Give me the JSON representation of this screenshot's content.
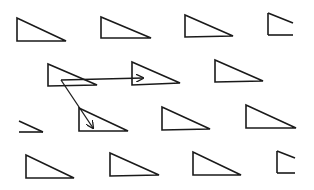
{
  "diagram": {
    "type": "translation-vectors-lattice",
    "stroke_color": "#1a1a1a",
    "background": "#ffffff",
    "triangles": [
      {
        "id": "r1c1",
        "points": [
          [
            17,
            18
          ],
          [
            17,
            41
          ],
          [
            66,
            41
          ]
        ]
      },
      {
        "id": "r1c2",
        "points": [
          [
            101,
            17
          ],
          [
            101,
            38
          ],
          [
            151,
            38
          ]
        ]
      },
      {
        "id": "r1c3",
        "points": [
          [
            185,
            15
          ],
          [
            185,
            37
          ],
          [
            233,
            36
          ]
        ]
      },
      {
        "id": "r2c1",
        "points": [
          [
            48,
            64
          ],
          [
            48,
            86
          ],
          [
            97,
            85
          ]
        ]
      },
      {
        "id": "r2c2",
        "points": [
          [
            132,
            62
          ],
          [
            132,
            85
          ],
          [
            180,
            83
          ]
        ]
      },
      {
        "id": "r2c3",
        "points": [
          [
            215,
            60
          ],
          [
            215,
            82
          ],
          [
            263,
            81
          ]
        ]
      },
      {
        "id": "r3c1",
        "points": [
          [
            79,
            108
          ],
          [
            79,
            131
          ],
          [
            128,
            131
          ]
        ]
      },
      {
        "id": "r3c2",
        "points": [
          [
            162,
            107
          ],
          [
            162,
            130
          ],
          [
            210,
            129
          ]
        ]
      },
      {
        "id": "r3c3",
        "points": [
          [
            246,
            105
          ],
          [
            246,
            128
          ],
          [
            296,
            128
          ]
        ]
      },
      {
        "id": "r4c1",
        "points": [
          [
            26,
            155
          ],
          [
            26,
            178
          ],
          [
            74,
            178
          ]
        ]
      },
      {
        "id": "r4c2",
        "points": [
          [
            110,
            153
          ],
          [
            110,
            176
          ],
          [
            159,
            175
          ]
        ]
      },
      {
        "id": "r4c3",
        "points": [
          [
            193,
            152
          ],
          [
            193,
            175
          ],
          [
            241,
            175
          ]
        ]
      }
    ],
    "partial_triangles": [
      {
        "id": "r1c4-cut",
        "segments": [
          [
            [
              268,
              13
            ],
            [
              268,
              35
            ]
          ],
          [
            [
              268,
              35
            ],
            [
              293,
              35
            ]
          ],
          [
            [
              268,
              13
            ],
            [
              293,
              23
            ]
          ]
        ]
      },
      {
        "id": "r3c0-cut",
        "segments": [
          [
            [
              19,
              121
            ],
            [
              43,
              132
            ]
          ],
          [
            [
              19,
              132
            ],
            [
              43,
              132
            ]
          ]
        ]
      },
      {
        "id": "r4c4-cut",
        "segments": [
          [
            [
              277,
              151
            ],
            [
              277,
              173
            ]
          ],
          [
            [
              277,
              173
            ],
            [
              295,
              173
            ]
          ],
          [
            [
              277,
              151
            ],
            [
              295,
              158
            ]
          ]
        ]
      }
    ],
    "vectors": [
      {
        "id": "vector-horizontal",
        "from": [
          61,
          80
        ],
        "to": [
          143,
          78
        ]
      },
      {
        "id": "vector-diagonal",
        "from": [
          61,
          80
        ],
        "to": [
          93,
          128
        ]
      }
    ]
  }
}
